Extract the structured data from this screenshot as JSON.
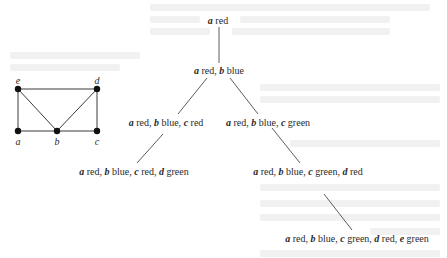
{
  "figure": {
    "colors": {
      "ink": "#2a2a2a",
      "vertex_fill": "#111111",
      "background": "#ffffff",
      "bleed_through": "#f1f1f1"
    }
  },
  "graph": {
    "vertices": [
      {
        "id": "e",
        "label": "e",
        "x": 18,
        "y": 89
      },
      {
        "id": "d",
        "label": "d",
        "x": 97,
        "y": 89
      },
      {
        "id": "a",
        "label": "a",
        "x": 18,
        "y": 131
      },
      {
        "id": "b",
        "label": "b",
        "x": 57,
        "y": 131
      },
      {
        "id": "c",
        "label": "c",
        "x": 97,
        "y": 131
      }
    ],
    "edges": [
      [
        "e",
        "d"
      ],
      [
        "e",
        "a"
      ],
      [
        "e",
        "b"
      ],
      [
        "d",
        "b"
      ],
      [
        "d",
        "c"
      ],
      [
        "a",
        "b"
      ],
      [
        "b",
        "c"
      ]
    ]
  },
  "tree": {
    "nodes": [
      {
        "id": "n0",
        "parts": [
          {
            "var": "a",
            "color": "red"
          }
        ]
      },
      {
        "id": "n1",
        "parts": [
          {
            "var": "a",
            "color": "red"
          },
          {
            "var": "b",
            "color": "blue"
          }
        ]
      },
      {
        "id": "n2",
        "parts": [
          {
            "var": "a",
            "color": "red"
          },
          {
            "var": "b",
            "color": "blue"
          },
          {
            "var": "c",
            "color": "red"
          }
        ]
      },
      {
        "id": "n3",
        "parts": [
          {
            "var": "a",
            "color": "red"
          },
          {
            "var": "b",
            "color": "blue"
          },
          {
            "var": "c",
            "color": "green"
          }
        ]
      },
      {
        "id": "n4",
        "parts": [
          {
            "var": "a",
            "color": "red"
          },
          {
            "var": "b",
            "color": "blue"
          },
          {
            "var": "c",
            "color": "red"
          },
          {
            "var": "d",
            "color": "green"
          }
        ]
      },
      {
        "id": "n5",
        "parts": [
          {
            "var": "a",
            "color": "red"
          },
          {
            "var": "b",
            "color": "blue"
          },
          {
            "var": "c",
            "color": "green"
          },
          {
            "var": "d",
            "color": "red"
          }
        ]
      },
      {
        "id": "n6",
        "parts": [
          {
            "var": "a",
            "color": "red"
          },
          {
            "var": "b",
            "color": "blue"
          },
          {
            "var": "c",
            "color": "green"
          },
          {
            "var": "d",
            "color": "red"
          },
          {
            "var": "e",
            "color": "green"
          }
        ]
      }
    ],
    "edges": [
      [
        "n0",
        "n1"
      ],
      [
        "n1",
        "n2"
      ],
      [
        "n1",
        "n3"
      ],
      [
        "n2",
        "n4"
      ],
      [
        "n3",
        "n5"
      ],
      [
        "n5",
        "n6"
      ]
    ]
  }
}
